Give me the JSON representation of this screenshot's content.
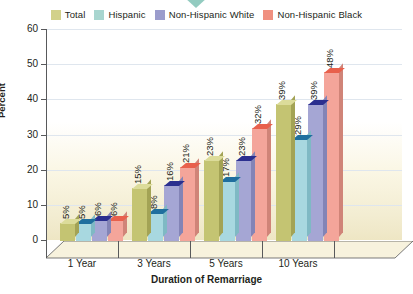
{
  "chart_data": {
    "type": "bar",
    "title": "",
    "xlabel": "Duration of Remarriage",
    "ylabel": "Percent",
    "ylim": [
      0,
      60
    ],
    "yticks": [
      0,
      10,
      20,
      30,
      40,
      50,
      60
    ],
    "grid": true,
    "legend_position": "top",
    "value_suffix": "%",
    "categories": [
      "1 Year",
      "3 Years",
      "5 Years",
      "10 Years"
    ],
    "series": [
      {
        "name": "Total",
        "color": "#c4c472",
        "top_color": "#dcdc9a",
        "side_color": "#a3a355",
        "values": [
          5,
          15,
          23,
          39
        ],
        "labels": [
          "5%",
          "15%",
          "23%",
          "39%"
        ]
      },
      {
        "name": "Hispanic",
        "color": "#a8d8e0",
        "top_color": "#1f6f9e",
        "side_color": "#7fb9c4",
        "values": [
          5,
          8,
          17,
          29
        ],
        "labels": [
          "5%",
          "8%",
          "17%",
          "29%"
        ]
      },
      {
        "name": "Non-Hispanic White",
        "color": "#a5a6d4",
        "top_color": "#2b2f8f",
        "side_color": "#8384b6",
        "values": [
          6,
          16,
          23,
          39
        ],
        "labels": [
          "6%",
          "16%",
          "23%",
          "39%"
        ]
      },
      {
        "name": "Non-Hispanic Black",
        "color": "#f4a59a",
        "top_color": "#e8604c",
        "side_color": "#d08478",
        "values": [
          6,
          21,
          32,
          48
        ],
        "labels": [
          "6%",
          "21%",
          "32%",
          "48%"
        ]
      }
    ]
  },
  "legend": {
    "items": [
      {
        "label": "Total",
        "color": "#d2d18a"
      },
      {
        "label": "Hispanic",
        "color": "#a8d5cf"
      },
      {
        "label": "Non-Hispanic White",
        "color": "#9b9ccc"
      },
      {
        "label": "Non-Hispanic Black",
        "color": "#f09080"
      }
    ]
  },
  "axis": {
    "y_title": "Percent",
    "x_title": "Duration of Remarriage",
    "y_tick_labels": [
      "60",
      "50",
      "40",
      "30",
      "20",
      "10",
      "0"
    ]
  }
}
